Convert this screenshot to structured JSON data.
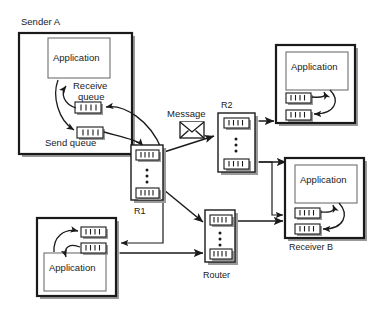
{
  "diagram": {
    "background": "#ffffff",
    "line_color": "#1a1a1a",
    "inner_box_color": "#6f6f6f",
    "shadow_color": "#9a9a9a"
  },
  "labels": {
    "sender_a": "Sender A",
    "receive_queue": "Receive\nqueue",
    "receive_queue_line1": "Receive",
    "receive_queue_line2": "queue",
    "send_queue": "Send queue",
    "message": "Message",
    "r1": "R1",
    "r2": "R2",
    "router": "Router",
    "receiver_b": "Receiver B",
    "application": "Application"
  },
  "nodes": {
    "sender_a": {
      "name": "Sender A",
      "application": "Application",
      "queues": [
        "Receive queue",
        "Send queue"
      ]
    },
    "host_top_right": {
      "name": "",
      "application": "Application",
      "queues": [
        "Receive queue",
        "Send queue"
      ]
    },
    "receiver_b": {
      "name": "Receiver B",
      "application": "Application",
      "queues": [
        "Receive queue",
        "Send queue"
      ]
    },
    "host_bottom_left": {
      "name": "",
      "application": "Application",
      "queues": [
        "Receive queue",
        "Send queue"
      ]
    },
    "r1": {
      "name": "R1",
      "type": "router",
      "queues": 2
    },
    "r2": {
      "name": "R2",
      "type": "router",
      "queues": 2
    },
    "router": {
      "name": "Router",
      "type": "router",
      "queues": 2
    }
  },
  "icons": {
    "message_envelope": "envelope-icon"
  }
}
